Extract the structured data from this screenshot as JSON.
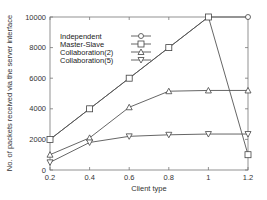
{
  "chart_data": {
    "type": "line",
    "title": "",
    "xlabel": "Client type",
    "ylabel": "No. of packets received via the server interface",
    "x": [
      0.2,
      0.4,
      0.6,
      0.8,
      1.0,
      1.2
    ],
    "xticks": [
      "0.2",
      "0.4",
      "0.6",
      "0.8",
      "1",
      "1.2"
    ],
    "yticks": [
      "0",
      "2000",
      "4000",
      "6000",
      "8000",
      "10000"
    ],
    "xlim": [
      0.2,
      1.2
    ],
    "ylim": [
      0,
      10000
    ],
    "grid": false,
    "legend_position": "top-left",
    "series": [
      {
        "name": "Independent",
        "marker": "circle",
        "values": [
          2000,
          4000,
          6000,
          8000,
          10000,
          10000
        ]
      },
      {
        "name": "Master-Slave",
        "marker": "square",
        "values": [
          2000,
          4000,
          6000,
          8000,
          10000,
          1000
        ]
      },
      {
        "name": "Collaboration(2)",
        "marker": "triangle-up",
        "values": [
          1000,
          2100,
          4100,
          5150,
          5200,
          5200
        ]
      },
      {
        "name": "Collaboration(5)",
        "marker": "triangle-down",
        "values": [
          500,
          1800,
          2200,
          2300,
          2350,
          2350
        ]
      }
    ]
  }
}
